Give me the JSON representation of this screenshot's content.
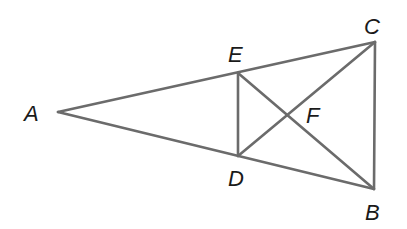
{
  "diagram": {
    "type": "geometry-figure",
    "stroke_color": "#6b6b6b",
    "label_color": "#1a1a1a",
    "points": {
      "A": {
        "x": 58,
        "y": 112
      },
      "E": {
        "x": 238,
        "y": 73
      },
      "C": {
        "x": 375,
        "y": 42
      },
      "D": {
        "x": 238,
        "y": 156
      },
      "B": {
        "x": 374,
        "y": 189
      },
      "F": {
        "x": 288,
        "y": 115
      }
    },
    "segments": [
      [
        "A",
        "C"
      ],
      [
        "A",
        "B"
      ],
      [
        "C",
        "B"
      ],
      [
        "E",
        "D"
      ],
      [
        "E",
        "B"
      ],
      [
        "D",
        "C"
      ]
    ],
    "labels": {
      "A": "A",
      "B": "B",
      "C": "C",
      "D": "D",
      "E": "E",
      "F": "F"
    }
  }
}
